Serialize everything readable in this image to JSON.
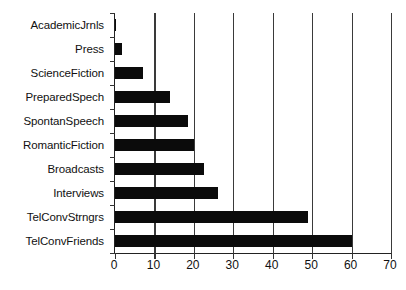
{
  "chart_data": {
    "type": "bar",
    "orientation": "horizontal",
    "title": "",
    "subtitle": "",
    "xlabel": "",
    "ylabel": "",
    "categories": [
      "AcademicJrnls",
      "Press",
      "ScienceFiction",
      "PreparedSpech",
      "SpontanSpeech",
      "RomanticFiction",
      "Broadcasts",
      "Interviews",
      "TelConvStrngrs",
      "TelConvFriends"
    ],
    "values": [
      0.3,
      1.8,
      7,
      14,
      18.5,
      20,
      22.5,
      26,
      49,
      60
    ],
    "xlim": [
      0,
      70
    ],
    "xticks": [
      0,
      10,
      20,
      30,
      40,
      50,
      60,
      70
    ],
    "xtick_labels": [
      "0",
      "10",
      "20",
      "30",
      "40",
      "50",
      "60",
      "70"
    ],
    "grid": "vertical",
    "legend": "none",
    "bar_color": "#0b0b0b",
    "axis_color": "#222222",
    "gridline_color": "#3a3a3a",
    "background_color": "#ffffff"
  }
}
